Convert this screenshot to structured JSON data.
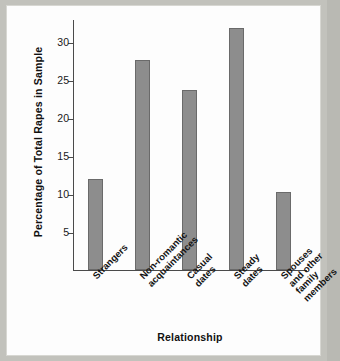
{
  "chart_data": {
    "type": "bar",
    "title": "",
    "xlabel": "Relationship",
    "ylabel": "Percentage of  Total Rapes in Sample",
    "categories": [
      "Strangers",
      "Non-romantic acquaintances",
      "Casual dates",
      "Steady dates",
      "Spouses and other family members"
    ],
    "category_lines": [
      [
        "Strangers"
      ],
      [
        "Non-romantic",
        "acquaintances"
      ],
      [
        "Casual",
        "dates"
      ],
      [
        "Steady",
        "dates"
      ],
      [
        "Spouses",
        "and other",
        "family",
        "members"
      ]
    ],
    "values": [
      12.0,
      27.6,
      23.7,
      31.8,
      10.3
    ],
    "ylim": [
      0,
      33
    ],
    "yticks": [
      5,
      10,
      15,
      20,
      25,
      30
    ],
    "ytick_labels": [
      "5",
      "10",
      "15",
      "20",
      "25",
      "30"
    ],
    "grid": false,
    "legend": false,
    "bar_color": "#8d8d8d",
    "bar_edge_color": "#6a6a6a",
    "axis_color": "#4a4a4a",
    "background_color": "#ffffff",
    "page_color": "#c2c2bc"
  }
}
